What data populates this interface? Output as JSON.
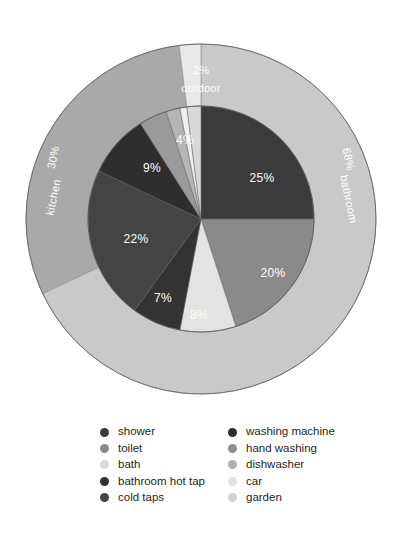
{
  "chart_data": {
    "type": "pie",
    "title": "",
    "subtitle": "",
    "xlabel": "",
    "ylabel": "",
    "legend_position": "bottom",
    "grid": false,
    "outer_ring": {
      "name": "room",
      "categories": [
        "bathroom",
        "kitchen",
        "outdoor"
      ],
      "values": [
        68,
        30,
        2
      ],
      "labels": [
        "68%",
        "30%",
        "2%"
      ],
      "label_text": [
        "bathroom",
        "kitchen",
        "outdoor"
      ],
      "colors": [
        "#c9c9c9",
        "#a9a9a9",
        "#e8e8e8"
      ]
    },
    "inner_pie": {
      "name": "appliance",
      "categories": [
        "shower",
        "toilet",
        "bath",
        "bathroom hot tap",
        "cold taps",
        "washing machine",
        "hand washing",
        "dishwasher",
        "car",
        "garden"
      ],
      "values": [
        25,
        20,
        8,
        7,
        22,
        9,
        4,
        2,
        1,
        2
      ],
      "labels": [
        "25%",
        "20%",
        "8%",
        "7%",
        "22%",
        "9%",
        "4%",
        "",
        "",
        ""
      ],
      "colors": [
        "#3b3b3b",
        "#8a8a8a",
        "#e3e3e3",
        "#333333",
        "#444444",
        "#2e2e2e",
        "#9a9a9a",
        "#b5b5b5",
        "#efefef",
        "#d8d8d8"
      ]
    },
    "slice_labels": {
      "shower": "25%",
      "toilet": "20%",
      "bath": "8%",
      "bathroom_hot_tap": "7%",
      "cold_taps": "22%",
      "washing_machine": "9%",
      "hand_washing": "4%"
    },
    "ring_labels": {
      "bathroom_pct": "68%",
      "bathroom_name": "bathroom",
      "kitchen_pct": "30%",
      "kitchen_name": "kitchen",
      "outdoor_pct": "2%",
      "outdoor_name": "outdoor"
    }
  },
  "legend": {
    "left_column": [
      {
        "label": "shower",
        "color": "#3b3b3b"
      },
      {
        "label": "toilet",
        "color": "#8a8a8a"
      },
      {
        "label": "bath",
        "color": "#dcdcdc"
      },
      {
        "label": "bathroom hot tap",
        "color": "#333333"
      },
      {
        "label": "cold taps",
        "color": "#444444"
      }
    ],
    "right_column": [
      {
        "label": "washing machine",
        "color": "#2e2e2e"
      },
      {
        "label": "hand washing",
        "color": "#8f8f8f"
      },
      {
        "label": "dishwasher",
        "color": "#b0b0b0"
      },
      {
        "label": "car",
        "color": "#e0e0e0"
      },
      {
        "label": "garden",
        "color": "#d2d2d2"
      }
    ]
  },
  "colors": {
    "background": "#ffffff",
    "text": "#231f20",
    "label_text": "#ffffff",
    "outline": "#6f6f6f"
  }
}
